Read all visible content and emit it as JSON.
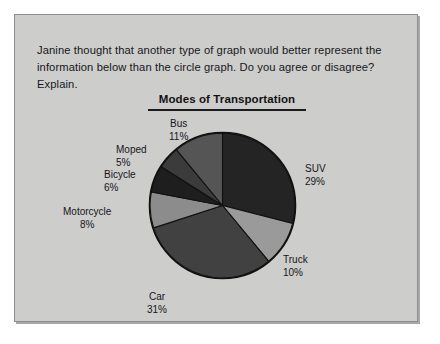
{
  "worksheet": {
    "prompt": "Janine thought that another type of graph would better represent the information below than the circle graph. Do you agree or disagree? Explain."
  },
  "chart_data": {
    "type": "pie",
    "title": "Modes of Transportation",
    "xlabel": "",
    "ylabel": "",
    "legend_position": "callout-labels",
    "grid": false,
    "unit": "%",
    "categories": [
      "SUV",
      "Truck",
      "Car",
      "Motorcycle",
      "Bicycle",
      "Moped",
      "Bus"
    ],
    "values": [
      29,
      10,
      31,
      8,
      6,
      5,
      11
    ],
    "labels": [
      {
        "name": "SUV",
        "pct": "29%",
        "value": 29,
        "color": "#242424"
      },
      {
        "name": "Truck",
        "pct": "10%",
        "value": 10,
        "color": "#9a9a9a"
      },
      {
        "name": "Car",
        "pct": "31%",
        "value": 31,
        "color": "#414141"
      },
      {
        "name": "Motorcycle",
        "pct": "8%",
        "value": 8,
        "color": "#8c8c8c"
      },
      {
        "name": "Bicycle",
        "pct": "6%",
        "value": 6,
        "color": "#1e1e1e"
      },
      {
        "name": "Moped",
        "pct": "5%",
        "value": 5,
        "color": "#3b3b3b"
      },
      {
        "name": "Bus",
        "pct": "11%",
        "value": 11,
        "color": "#555555"
      }
    ],
    "colors": {
      "SUV": "#242424",
      "Truck": "#9a9a9a",
      "Car": "#414141",
      "Motorcycle": "#8c8c8c",
      "Bicycle": "#1e1e1e",
      "Moped": "#3b3b3b",
      "Bus": "#555555",
      "page_background": "#cdcdcb",
      "outline": "#111111"
    }
  }
}
